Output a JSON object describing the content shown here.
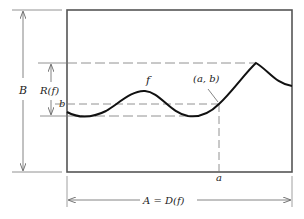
{
  "diagram": {
    "labels": {
      "function_name": "f",
      "point": "(a, b)",
      "y_value": "b",
      "x_value": "a",
      "range": "R(f)",
      "codomain": "B",
      "domain": "A = D(f)"
    },
    "colors": {
      "curve": "#111111",
      "box": "#555555",
      "dashed": "#777777",
      "arrows": "#666666",
      "text": "#222222"
    }
  }
}
